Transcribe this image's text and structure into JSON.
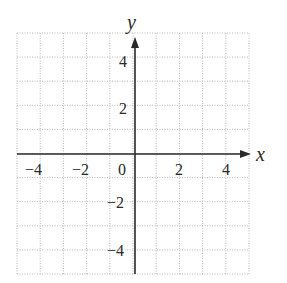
{
  "chart_data": {
    "type": "scatter",
    "title": "",
    "xlabel": "x",
    "ylabel": "y",
    "xlim": [
      -5,
      5
    ],
    "ylim": [
      -5,
      5
    ],
    "grid": true,
    "grid_style": "dotted",
    "grid_step": 1,
    "x_ticks": [
      -4,
      -2,
      0,
      2,
      4
    ],
    "y_ticks": [
      4,
      2,
      -2,
      -4
    ],
    "x_tick_labels": [
      "−4",
      "−2",
      "0",
      "2",
      "4"
    ],
    "y_tick_labels": [
      "4",
      "2",
      "−2",
      "−4"
    ],
    "series": [],
    "colors": {
      "axis": "#2a2a2a",
      "grid": "#b8b8b8",
      "background": "#ffffff"
    }
  },
  "labels": {
    "x_axis": "x",
    "y_axis": "y",
    "x_ticks": {
      "n4": "−4",
      "n2": "−2",
      "zero": "0",
      "p2": "2",
      "p4": "4"
    },
    "y_ticks": {
      "p4": "4",
      "p2": "2",
      "n2": "−2",
      "n4": "−4"
    }
  }
}
